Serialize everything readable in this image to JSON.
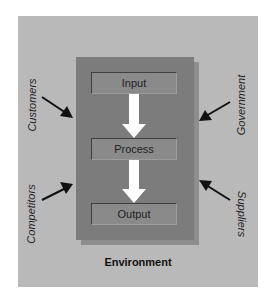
{
  "diagram": {
    "environment_label": "Environment",
    "stages": [
      {
        "label": "Input"
      },
      {
        "label": "Process"
      },
      {
        "label": "Output"
      }
    ],
    "external_forces": {
      "left": [
        {
          "label": "Customers"
        },
        {
          "label": "Competitors"
        }
      ],
      "right": [
        {
          "label": "Government"
        },
        {
          "label": "Suppliers"
        }
      ]
    },
    "colors": {
      "panel": "#b9b9b9",
      "system_box": "#7c7c7c",
      "stage_box": "#8a8a8a",
      "flow_arrow": "#ffffff",
      "force_arrow": "#111111"
    }
  }
}
